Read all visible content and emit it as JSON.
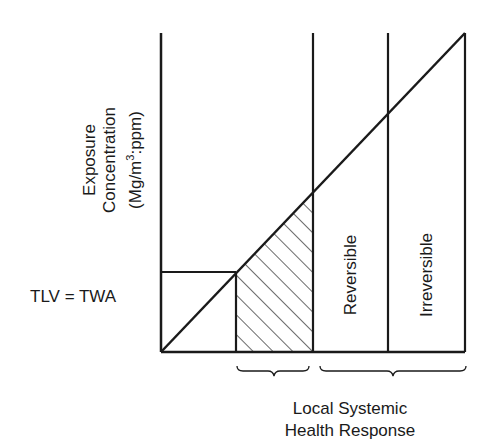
{
  "diagram": {
    "y_axis_label": {
      "line1": "Exposure",
      "line2": "Concentration",
      "line3_prefix": "(Mg/m",
      "line3_sup": "3",
      "line3_suffix": ":ppm)"
    },
    "threshold_label": "TLV = TWA",
    "regions": [
      {
        "name": "below-threshold",
        "label": ""
      },
      {
        "name": "local-response",
        "label": "",
        "hatched": true
      },
      {
        "name": "reversible",
        "label": "Reversible"
      },
      {
        "name": "irreversible",
        "label": "Irreversible"
      }
    ],
    "x_axis_label": {
      "line1": "Local Systemic",
      "line2": "Health Response"
    },
    "colors": {
      "line": "#1a1a1a",
      "background": "#ffffff"
    }
  }
}
